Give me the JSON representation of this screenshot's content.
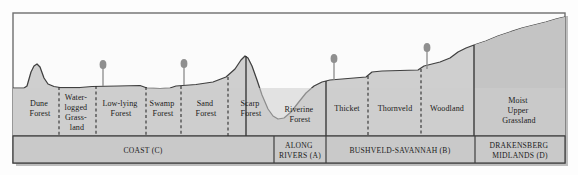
{
  "diagram": {
    "colors": {
      "sky": "#fbfbfb",
      "terrain_fill": "#cfcfcf",
      "band_fill": "#c9c9c9",
      "outline": "#3a3a3a",
      "frame": "#6e6e6e",
      "text": "#1b1b1b",
      "tree": "#8f8f8f"
    },
    "vegetation_zones": [
      {
        "id": "dune-forest",
        "label_lines": [
          "Dune",
          "Forest"
        ],
        "x_center": 40,
        "divider": "solid"
      },
      {
        "id": "waterlogged-grassland",
        "label_lines": [
          "Water-",
          "logged",
          "Grass-",
          "land"
        ],
        "x_center": 77,
        "divider": "dashed"
      },
      {
        "id": "low-lying-forest",
        "label_lines": [
          "Low-lying",
          "Forest"
        ],
        "x_center": 121,
        "divider": "dashed"
      },
      {
        "id": "swamp-forest",
        "label_lines": [
          "Swamp",
          "Forest"
        ],
        "x_center": 163,
        "divider": "dashed"
      },
      {
        "id": "sand-forest",
        "label_lines": [
          "Sand",
          "Forest"
        ],
        "x_center": 206,
        "divider": "dashed"
      },
      {
        "id": "scarp-forest",
        "label_lines": [
          "Scarp",
          "Forest"
        ],
        "x_center": 251,
        "divider": "dashed"
      },
      {
        "id": "riverine-forest",
        "label_lines": [
          "Riverine",
          "Forest"
        ],
        "x_center": 300,
        "divider": "solid"
      },
      {
        "id": "thicket",
        "label_lines": [
          "Thicket"
        ],
        "x_center": 345,
        "divider": "solid"
      },
      {
        "id": "thornveld",
        "label_lines": [
          "Thornveld"
        ],
        "x_center": 394,
        "divider": "dashed"
      },
      {
        "id": "woodland",
        "label_lines": [
          "Woodland"
        ],
        "x_center": 447,
        "divider": "dashed"
      },
      {
        "id": "moist-upper-grassland",
        "label_lines": [
          "Moist",
          "Upper",
          "Grassland"
        ],
        "x_center": 518,
        "divider": "solid"
      }
    ],
    "regions": [
      {
        "id": "coast",
        "label_lines": [
          "COAST (C)"
        ],
        "x_center": 143,
        "x_start": 13,
        "x_end": 274
      },
      {
        "id": "along-rivers",
        "label_lines": [
          "ALONG",
          "RIVERS (A)"
        ],
        "x_center": 300,
        "x_start": 274,
        "x_end": 326
      },
      {
        "id": "bushveld-savannah",
        "label_lines": [
          "BUSHVELD-SAVANNAH (B)"
        ],
        "x_center": 400,
        "x_start": 326,
        "x_end": 475
      },
      {
        "id": "drakensberg-midlands",
        "label_lines": [
          "DRAKENSBERG",
          "MIDLANDS (D)"
        ],
        "x_center": 519,
        "x_start": 475,
        "x_end": 565
      }
    ],
    "tree_markers": [
      {
        "id": "tree-low-lying-forest",
        "x": 103,
        "y_ground": 85
      },
      {
        "id": "tree-sand-forest",
        "x": 184,
        "y_ground": 85
      },
      {
        "id": "tree-thicket",
        "x": 334,
        "y_ground": 80
      },
      {
        "id": "tree-woodland",
        "x": 427,
        "y_ground": 73
      }
    ],
    "frame": {
      "x": 13,
      "y": 13,
      "width": 552,
      "height": 150
    },
    "band_row": {
      "y_top": 136,
      "y_bottom": 163
    },
    "zone_row": {
      "y_top": 85,
      "y_bottom": 136
    }
  }
}
